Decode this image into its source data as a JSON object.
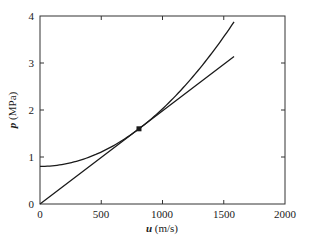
{
  "chart_data": {
    "type": "line",
    "title": "",
    "xlabel_var": "u",
    "xlabel_unit": " (m/s)",
    "ylabel_var": "p",
    "ylabel_unit": " (MPa)",
    "xlim": [
      0,
      2000
    ],
    "ylim": [
      0,
      4
    ],
    "xticks": [
      0,
      500,
      1000,
      1500,
      2000
    ],
    "yticks": [
      0,
      1,
      2,
      3,
      4
    ],
    "grid": false,
    "legend": null,
    "series": [
      {
        "name": "parabolic curve",
        "description": "p = 0.8 + k*u^2, tangent to the line at the marked point",
        "x": [
          0,
          200,
          400,
          600,
          808,
          1000,
          1200,
          1400,
          1584
        ],
        "y": [
          0.8,
          0.85,
          1.0,
          1.24,
          1.6,
          2.02,
          2.56,
          3.2,
          3.87
        ]
      },
      {
        "name": "straight line",
        "description": "line through origin, tangent to curve at marked point",
        "x": [
          0,
          808,
          1584
        ],
        "y": [
          0,
          1.6,
          3.14
        ]
      }
    ],
    "annotations": [
      {
        "type": "marker",
        "shape": "square",
        "x": 808,
        "y": 1.6,
        "label": "tangent point"
      }
    ]
  },
  "axes": {
    "x_tick_labels": [
      "0",
      "500",
      "1000",
      "1500",
      "2000"
    ],
    "y_tick_labels": [
      "0",
      "1",
      "2",
      "3",
      "4"
    ],
    "x_label_var": "u",
    "x_label_unit": " (m/s)",
    "y_label_var": "p",
    "y_label_unit": " (MPa)"
  },
  "colors": {
    "line": "#1a1a1a",
    "axes": "#333333",
    "background": "#ffffff"
  }
}
